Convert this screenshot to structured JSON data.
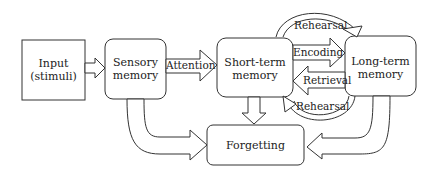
{
  "diagram": {
    "type": "memory-model-flowchart",
    "nodes": {
      "input": {
        "label_line1": "Input",
        "label_line2": "(stimuli)"
      },
      "sensory": {
        "label_line1": "Sensory",
        "label_line2": "memory"
      },
      "short_term": {
        "label_line1": "Short-term",
        "label_line2": "memory"
      },
      "long_term": {
        "label_line1": "Long-term",
        "label_line2": "memory"
      },
      "forgetting": {
        "label": "Forgetting"
      }
    },
    "edges": {
      "attention": "Attention",
      "encoding": "Encoding",
      "retrieval": "Retrieval",
      "rehearsal_top": "Rehearsal",
      "rehearsal_bottom": "Rehearsal"
    },
    "colors": {
      "stroke": "#333333",
      "background": "#ffffff",
      "text": "#222222"
    }
  }
}
